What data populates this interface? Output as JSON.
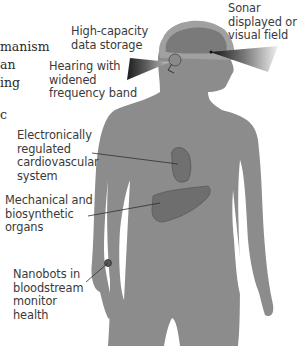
{
  "left_text_fragments": [
    "manism",
    "an",
    "ing",
    "",
    "c"
  ],
  "labels": {
    "data_storage": [
      "High-capacity",
      "data storage"
    ],
    "sonar": [
      "Sonar",
      "displayed on",
      "visual field"
    ],
    "hearing": [
      "Hearing with",
      "widened",
      "frequency band"
    ],
    "cardio": [
      "Electronically",
      "regulated",
      "cardiovascular",
      "system"
    ],
    "organs": [
      "Mechanical and",
      "biosynthetic",
      "organs"
    ],
    "nanobots": [
      "Nanobots in",
      "bloodstream",
      "monitor",
      "health"
    ]
  },
  "colors": {
    "body": "#8c8c8c",
    "head_outline": "#a8a8a8",
    "brain": "#7a7a7a",
    "organ": "#6e6e6e",
    "leader_line": "#2e2e2e",
    "text": "#3a3a3a"
  }
}
